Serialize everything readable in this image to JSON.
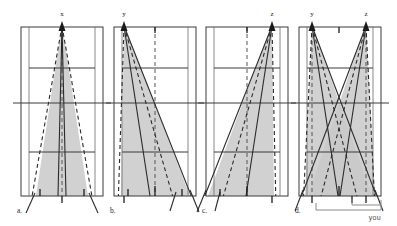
{
  "figure": {
    "type": "diagram",
    "width": 397,
    "height": 226,
    "background": "#ffffff",
    "shade_color": "#c9c9c9",
    "line_color": "#3a3a3a",
    "ray_color": "#2b2b2b"
  },
  "panels": [
    {
      "id": "a",
      "caption": "a.",
      "origin_label": "x",
      "origin_x_frac": 0.5,
      "description": "narrow symmetric wedge from centre position x",
      "apex": {
        "x": 62,
        "y": 24
      },
      "rays_solid": [
        {
          "x": 38,
          "y": 206
        },
        {
          "x": 86,
          "y": 206
        }
      ],
      "rays_dashed": [
        {
          "x": 32,
          "y": 206
        },
        {
          "x": 92,
          "y": 206
        }
      ],
      "shade_base_left": 36,
      "shade_base_right": 88
    },
    {
      "id": "b",
      "caption": "b.",
      "origin_label": "y",
      "origin_x_frac": 0.12,
      "description": "wedge from left-side position y fanning right",
      "apex": {
        "x": 124,
        "y": 24
      },
      "rays_solid": [
        {
          "x": 122,
          "y": 206
        },
        {
          "x": 192,
          "y": 206
        }
      ],
      "rays_dashed": [
        {
          "x": 118,
          "y": 206
        },
        {
          "x": 178,
          "y": 206
        }
      ],
      "shade_base_left": 121,
      "shade_base_right": 190
    },
    {
      "id": "c",
      "caption": "c.",
      "origin_label": "z",
      "origin_x_frac": 0.88,
      "description": "wedge from right-side position z fanning left",
      "apex": {
        "x": 272,
        "y": 24
      },
      "rays_solid": [
        {
          "x": 206,
          "y": 206
        },
        {
          "x": 274,
          "y": 206
        }
      ],
      "rays_dashed": [
        {
          "x": 220,
          "y": 206
        },
        {
          "x": 276,
          "y": 206
        }
      ],
      "shade_base_left": 208,
      "shade_base_right": 274
    },
    {
      "id": "d",
      "caption": "d.",
      "origin_label_left": "y",
      "origin_label_right": "z",
      "description": "both wedges overlaid, crossing; bracket marks coverage",
      "apex_left": {
        "x": 312,
        "y": 24
      },
      "apex_right": {
        "x": 366,
        "y": 24
      },
      "bracket_label": "you"
    }
  ],
  "labels": {
    "origin_x": "x",
    "origin_y": "y",
    "origin_z": "z",
    "panel_a": "a.",
    "panel_b": "b.",
    "panel_c": "c.",
    "panel_d": "d.",
    "bracket_you": "you"
  }
}
